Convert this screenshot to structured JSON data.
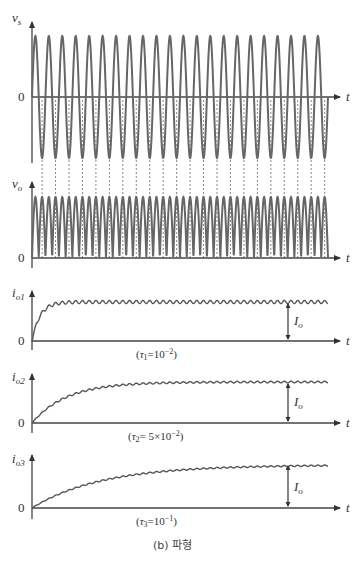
{
  "figure": {
    "caption": "(b) 파형",
    "time_axis_label": "t",
    "zero_label": "0",
    "dc_level_label": "Io",
    "source_cycles": 22
  },
  "panels": [
    {
      "id": "vs",
      "ylabel_main": "v",
      "ylabel_sub": "s",
      "kind": "sine",
      "description": "source voltage, full sine"
    },
    {
      "id": "vo",
      "ylabel_main": "v",
      "ylabel_sub": "o",
      "kind": "rectified",
      "description": "full-wave rectified output voltage"
    },
    {
      "id": "io1",
      "ylabel_main": "i",
      "ylabel_sub": "o1",
      "kind": "current",
      "tau_label": "(τ1=10⁻²)",
      "tau_sym": "τ",
      "tau_sub": "1",
      "tau_eq": "=10",
      "tau_exp": "−2",
      "tau_close": ")",
      "time_constant": 0.01,
      "rise_fraction": 0.08,
      "ripple": 0.08
    },
    {
      "id": "io2",
      "ylabel_main": "i",
      "ylabel_sub": "o2",
      "kind": "current",
      "tau_label": "(τ2= 5×10⁻²)",
      "tau_sym": "τ",
      "tau_sub": "2",
      "tau_eq": "= 5×10",
      "tau_exp": "−2",
      "tau_close": ")",
      "time_constant": 0.05,
      "rise_fraction": 0.35,
      "ripple": 0.04
    },
    {
      "id": "io3",
      "ylabel_main": "i",
      "ylabel_sub": "o3",
      "kind": "current",
      "tau_label": "(τ3=10⁻¹)",
      "tau_sym": "τ",
      "tau_sub": "3",
      "tau_eq": "=10",
      "tau_exp": "−1",
      "tau_close": ")",
      "time_constant": 0.1,
      "rise_fraction": 0.7,
      "ripple": 0.03
    }
  ]
}
